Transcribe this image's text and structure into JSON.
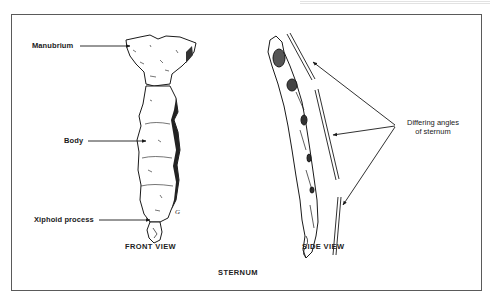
{
  "figure": {
    "title": "STERNUM",
    "views": [
      {
        "id": "front",
        "caption": "FRONT VIEW"
      },
      {
        "id": "side",
        "caption": "SIDE VIEW"
      }
    ],
    "front_view": {
      "labels": [
        {
          "text": "Manubrium",
          "target": "manubrium"
        },
        {
          "text": "Body",
          "target": "body"
        },
        {
          "text": "Xiphoid process",
          "target": "xiphoid"
        }
      ],
      "artist_mark": "G"
    },
    "side_view": {
      "annotation": {
        "line1": "Differing angles",
        "line2": "of sternum",
        "arrow_count": 3
      }
    }
  },
  "colors": {
    "ink": "#1a1a1a",
    "frame": "#5a5a5a",
    "background": "#ffffff"
  }
}
